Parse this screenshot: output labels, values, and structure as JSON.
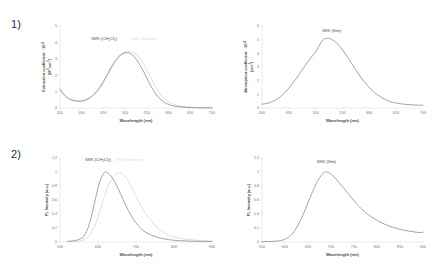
{
  "figure": {
    "row_labels": [
      "1)",
      "2)"
    ],
    "background": "#ffffff",
    "colors": {
      "curve_dark": "#6b6b6b",
      "curve_light": "#d2d2d2",
      "axis": "#c8c8c8",
      "text": "#6f6f6f"
    }
  },
  "chart_data": [
    {
      "type": "line",
      "panel": "top-left",
      "title": "",
      "annotations": [
        {
          "text": "IWK (CH₂Cl₂)",
          "color": "#4a4a4a",
          "x": 452,
          "y": 4.15
        },
        {
          "text": "IWK (toluene)",
          "color": "#dcdcdc",
          "x": 545,
          "y": 4.15
        }
      ],
      "xlabel": "Wavelength (nm)",
      "ylabel": "Extinction coefficient · 10⁻⁴ (M⁻¹cm⁻¹)",
      "ylabel_line1": "Extinction coefficient · 10",
      "ylabel_line1_sup": "-4",
      "ylabel_line2": "(M",
      "ylabel_line2_sup": "-1",
      "ylabel_line2_rest": "cm",
      "ylabel_line2_sup2": "-1",
      "ylabel_line2_end": ")",
      "xlim": [
        350,
        700
      ],
      "ylim": [
        0,
        5
      ],
      "xticks": [
        350,
        400,
        450,
        500,
        550,
        600,
        650,
        700
      ],
      "yticks": [
        0,
        1,
        2,
        3,
        4,
        5
      ],
      "grid": false,
      "legend": "inline-annotation",
      "x": [
        350,
        360,
        370,
        380,
        390,
        400,
        410,
        420,
        430,
        440,
        450,
        460,
        470,
        480,
        490,
        500,
        505,
        510,
        520,
        530,
        540,
        550,
        560,
        570,
        580,
        590,
        600,
        610,
        620,
        630,
        640,
        650,
        660,
        680,
        700
      ],
      "series": [
        {
          "name": "IWK (CH2Cl2)",
          "color": "#6b6b6b",
          "values": [
            1.15,
            0.8,
            0.58,
            0.46,
            0.42,
            0.43,
            0.5,
            0.65,
            0.88,
            1.2,
            1.62,
            2.1,
            2.58,
            2.98,
            3.25,
            3.37,
            3.38,
            3.34,
            3.15,
            2.8,
            2.35,
            1.82,
            1.3,
            0.88,
            0.56,
            0.35,
            0.22,
            0.14,
            0.09,
            0.06,
            0.04,
            0.03,
            0.02,
            0.01,
            0.01
          ]
        },
        {
          "name": "IWK (toluene)",
          "color": "#d2d2d2",
          "values": [
            1.1,
            0.78,
            0.57,
            0.45,
            0.41,
            0.42,
            0.48,
            0.62,
            0.84,
            1.14,
            1.54,
            2.0,
            2.48,
            2.9,
            3.22,
            3.4,
            3.42,
            3.43,
            3.36,
            3.15,
            2.8,
            2.32,
            1.8,
            1.3,
            0.88,
            0.58,
            0.37,
            0.24,
            0.16,
            0.11,
            0.08,
            0.06,
            0.04,
            0.02,
            0.01
          ]
        }
      ]
    },
    {
      "type": "line",
      "panel": "top-right",
      "title": "",
      "annotations": [
        {
          "text": "IWK (film)",
          "color": "#4a4a4a",
          "x": 530,
          "y": 5.55
        }
      ],
      "xlabel": "Wavelength (nm)",
      "ylabel": "Absorption coefficient · 10⁻⁴ (cm⁻¹)",
      "ylabel_line1": "Absorption coefficient · 10",
      "ylabel_line1_sup": "-4",
      "ylabel_line2": "(cm",
      "ylabel_line2_sup": "-1",
      "ylabel_line2_end": ")",
      "xlim": [
        400,
        700
      ],
      "ylim": [
        0,
        6
      ],
      "xticks": [
        400,
        450,
        500,
        550,
        600,
        650,
        700
      ],
      "yticks": [
        0,
        1,
        2,
        3,
        4,
        5,
        6
      ],
      "grid": false,
      "x": [
        400,
        410,
        420,
        430,
        440,
        450,
        460,
        470,
        480,
        490,
        500,
        510,
        515,
        520,
        530,
        540,
        550,
        560,
        570,
        580,
        590,
        600,
        610,
        620,
        630,
        640,
        650,
        660,
        670,
        680,
        690,
        700
      ],
      "series": [
        {
          "name": "IWK (film)",
          "color": "#6b6b6b",
          "values": [
            0.28,
            0.34,
            0.48,
            0.7,
            1.02,
            1.45,
            1.95,
            2.5,
            3.08,
            3.62,
            4.12,
            4.78,
            5.02,
            5.1,
            5.02,
            4.72,
            4.25,
            3.7,
            3.08,
            2.48,
            1.95,
            1.5,
            1.12,
            0.84,
            0.62,
            0.46,
            0.36,
            0.3,
            0.26,
            0.23,
            0.21,
            0.2
          ]
        }
      ]
    },
    {
      "type": "line",
      "panel": "bottom-left",
      "title": "",
      "annotations": [
        {
          "text": "IWK (CH₂Cl₂)",
          "color": "#4a4a4a",
          "x": 600,
          "y": 1.16
        },
        {
          "text": "IWK (toluene)",
          "color": "#dcdcdc",
          "x": 683,
          "y": 1.16
        }
      ],
      "xlabel": "Wavelength (nm)",
      "ylabel": "PL Intensity (a.u.)",
      "xlim": [
        500,
        900
      ],
      "ylim": [
        0,
        1.2
      ],
      "xticks": [
        500,
        600,
        700,
        800,
        900
      ],
      "yticks": [
        0,
        0.2,
        0.4,
        0.6,
        0.8,
        1,
        1.2
      ],
      "grid": false,
      "x": [
        520,
        540,
        555,
        565,
        575,
        585,
        595,
        605,
        615,
        620,
        625,
        635,
        645,
        655,
        665,
        675,
        685,
        695,
        705,
        715,
        725,
        740,
        755,
        770,
        790,
        810,
        830,
        850,
        870,
        890,
        900
      ],
      "series": [
        {
          "name": "IWK (CH2Cl2)",
          "color": "#6b6b6b",
          "values": [
            0.01,
            0.02,
            0.05,
            0.1,
            0.22,
            0.42,
            0.66,
            0.87,
            0.98,
            1.0,
            0.99,
            0.94,
            0.85,
            0.74,
            0.62,
            0.5,
            0.4,
            0.31,
            0.24,
            0.18,
            0.14,
            0.1,
            0.07,
            0.05,
            0.03,
            0.02,
            0.015,
            0.01,
            0.01,
            0.008,
            0.008
          ]
        },
        {
          "name": "IWK (toluene)",
          "color": "#d2d2d2",
          "values": [
            0.005,
            0.01,
            0.02,
            0.04,
            0.08,
            0.16,
            0.28,
            0.44,
            0.62,
            0.7,
            0.78,
            0.89,
            0.96,
            0.99,
            0.97,
            0.91,
            0.82,
            0.71,
            0.6,
            0.5,
            0.41,
            0.3,
            0.21,
            0.15,
            0.09,
            0.06,
            0.04,
            0.03,
            0.02,
            0.015,
            0.012
          ]
        }
      ]
    },
    {
      "type": "line",
      "panel": "bottom-right",
      "title": "",
      "annotations": [
        {
          "text": "IWK (film)",
          "color": "#4a4a4a",
          "x": 690,
          "y": 1.13
        }
      ],
      "xlabel": "Wavelength (nm)",
      "ylabel": "PL Intensity (a.u.)",
      "xlim": [
        550,
        900
      ],
      "ylim": [
        0,
        1.2
      ],
      "xticks": [
        550,
        600,
        650,
        700,
        750,
        800,
        850,
        900
      ],
      "yticks": [
        0,
        0.2,
        0.4,
        0.6,
        0.8,
        1,
        1.2
      ],
      "grid": false,
      "x": [
        550,
        570,
        590,
        600,
        610,
        620,
        630,
        640,
        650,
        660,
        670,
        680,
        688,
        695,
        705,
        715,
        725,
        735,
        745,
        755,
        765,
        775,
        785,
        795,
        805,
        815,
        825,
        835,
        845,
        855,
        865,
        875,
        885,
        895,
        900
      ],
      "series": [
        {
          "name": "IWK (film)",
          "color": "#6b6b6b",
          "values": [
            0.005,
            0.008,
            0.02,
            0.04,
            0.08,
            0.15,
            0.26,
            0.4,
            0.56,
            0.72,
            0.86,
            0.96,
            1.0,
            0.99,
            0.94,
            0.87,
            0.79,
            0.71,
            0.63,
            0.55,
            0.48,
            0.42,
            0.37,
            0.33,
            0.29,
            0.26,
            0.23,
            0.21,
            0.19,
            0.175,
            0.16,
            0.15,
            0.14,
            0.135,
            0.14
          ]
        }
      ]
    }
  ]
}
